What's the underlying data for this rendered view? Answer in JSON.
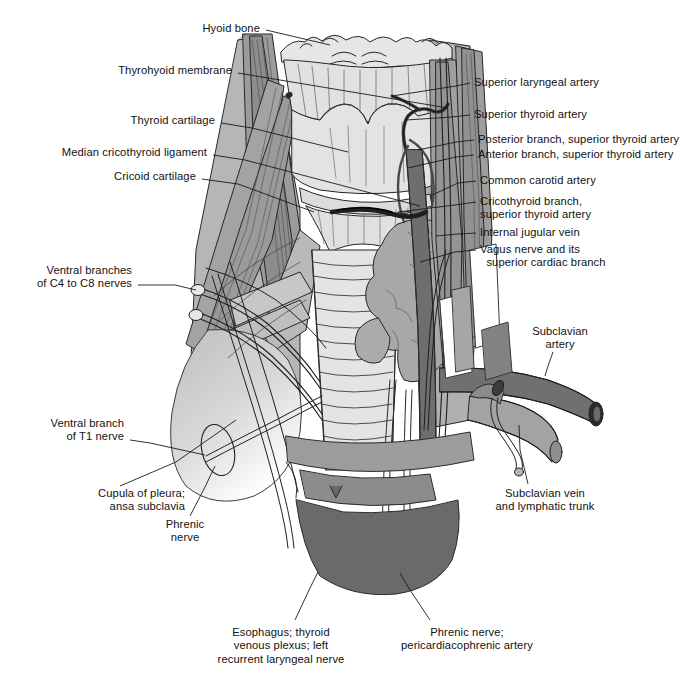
{
  "figure": {
    "domain": "anatomical-illustration",
    "background_color": "#ffffff",
    "line_color": "#1a1a1a",
    "text_color": "#111111",
    "palette": {
      "cartilage_light": "#e2e2e2",
      "cartilage_mid": "#d3d3d3",
      "muscle_light": "#c2c2c2",
      "muscle_mid": "#a6a6a6",
      "muscle_dark": "#8f8f8f",
      "vessel_dark": "#6e6e6e",
      "vessel_darker": "#5c5c5c",
      "gland_mid": "#a9a9a9",
      "pleura_pale": "#cfcfcf",
      "white": "#ffffff"
    }
  },
  "labels": [
    {
      "id": "hyoid-bone",
      "text": "Hyoid bone",
      "align": "right",
      "x": 260,
      "y": 22,
      "leader": [
        [
          266,
          30
        ],
        [
          330,
          45
        ]
      ]
    },
    {
      "id": "thyrohyoid-membrane",
      "text": "Thyrohyoid membrane",
      "align": "right",
      "x": 232,
      "y": 64,
      "leader": [
        [
          238,
          73
        ],
        [
          268,
          78
        ],
        [
          448,
          108
        ]
      ]
    },
    {
      "id": "thyroid-cartilage",
      "text": "Thyroid cartilage",
      "align": "right",
      "x": 215,
      "y": 114,
      "leader": [
        [
          221,
          123
        ],
        [
          252,
          128
        ],
        [
          348,
          152
        ]
      ]
    },
    {
      "id": "median-cricothyroid-ligament",
      "text": "Median cricothyroid ligament",
      "align": "right",
      "x": 207,
      "y": 146,
      "leader": [
        [
          213,
          155
        ],
        [
          245,
          160
        ],
        [
          420,
          206
        ]
      ]
    },
    {
      "id": "cricoid-cartilage",
      "text": "Cricoid cartilage",
      "align": "right",
      "x": 196,
      "y": 170,
      "leader": [
        [
          202,
          179
        ],
        [
          238,
          184
        ],
        [
          314,
          212
        ]
      ]
    },
    {
      "id": "ventral-branches-c4-c8",
      "text": "Ventral branches\nof C4 to C8 nerves",
      "align": "right",
      "x": 132,
      "y": 264,
      "leader": [
        [
          138,
          285
        ],
        [
          175,
          285
        ],
        [
          196,
          290
        ]
      ]
    },
    {
      "id": "ventral-branch-t1",
      "text": "Ventral branch\nof T1 nerve",
      "align": "right",
      "x": 124,
      "y": 417,
      "leader": [
        [
          130,
          440
        ],
        [
          150,
          443
        ],
        [
          205,
          455
        ]
      ]
    },
    {
      "id": "cupula-of-pleura",
      "text": "Cupula of pleura;\nansa subclavia",
      "align": "right",
      "x": 185,
      "y": 487,
      "leader": [
        [
          120,
          486
        ],
        [
          176,
          462
        ],
        [
          236,
          420
        ]
      ]
    },
    {
      "id": "phrenic-nerve",
      "text": "Phrenic\nnerve",
      "align": "center",
      "x": 185,
      "y": 518,
      "leader": [
        [
          190,
          516
        ],
        [
          205,
          487
        ],
        [
          215,
          466
        ]
      ]
    },
    {
      "id": "esophagus-thyroid-venous-plexus",
      "text": "Esophagus; thyroid\nvenous plexus; left\nrecurrent laryngeal nerve",
      "align": "center",
      "x": 281,
      "y": 626,
      "leader": [
        [
          295,
          620
        ],
        [
          310,
          588
        ],
        [
          318,
          572
        ]
      ]
    },
    {
      "id": "phrenic-nerve-pericardiacophrenic-artery",
      "text": "Phrenic nerve;\npericardiacophrenic artery",
      "align": "center",
      "x": 467,
      "y": 626,
      "leader": [
        [
          430,
          620
        ],
        [
          410,
          590
        ],
        [
          400,
          573
        ]
      ]
    },
    {
      "id": "superior-laryngeal-artery",
      "text": "Superior laryngeal artery",
      "align": "left",
      "x": 474,
      "y": 76,
      "leader": [
        [
          470,
          83
        ],
        [
          456,
          86
        ],
        [
          392,
          96
        ]
      ]
    },
    {
      "id": "superior-thyroid-artery",
      "text": "Superior thyroid artery",
      "align": "left",
      "x": 474,
      "y": 108,
      "leader": [
        [
          470,
          115
        ],
        [
          452,
          117
        ],
        [
          406,
          120
        ]
      ]
    },
    {
      "id": "posterior-branch-superior-thyroid-artery",
      "text": "Posterior branch, superior thyroid artery",
      "align": "left",
      "x": 478,
      "y": 133,
      "leader": [
        [
          474,
          140
        ],
        [
          456,
          142
        ],
        [
          418,
          150
        ]
      ]
    },
    {
      "id": "anterior-branch-superior-thyroid-artery",
      "text": "Anterior branch, superior thyroid artery",
      "align": "left",
      "x": 478,
      "y": 148,
      "leader": [
        [
          474,
          155
        ],
        [
          456,
          157
        ],
        [
          408,
          168
        ]
      ]
    },
    {
      "id": "common-carotid-artery",
      "text": "Common carotid artery",
      "align": "left",
      "x": 480,
      "y": 174,
      "leader": [
        [
          476,
          181
        ],
        [
          458,
          183
        ],
        [
          430,
          196
        ]
      ]
    },
    {
      "id": "cricothyroid-branch",
      "text": "Cricothyroid branch,\nsuperior thyroid artery",
      "align": "left",
      "x": 480,
      "y": 195,
      "leader": [
        [
          476,
          202
        ],
        [
          455,
          205
        ],
        [
          398,
          212
        ]
      ]
    },
    {
      "id": "internal-jugular-vein",
      "text": "Internal jugular vein",
      "align": "left",
      "x": 480,
      "y": 226,
      "leader": [
        [
          476,
          233
        ],
        [
          458,
          234
        ],
        [
          436,
          236
        ]
      ]
    },
    {
      "id": "vagus-nerve",
      "text": "Vagus nerve and its\n  superior cardiac branch",
      "align": "left",
      "x": 480,
      "y": 243,
      "leader": [
        [
          476,
          250
        ],
        [
          455,
          252
        ],
        [
          420,
          262
        ]
      ]
    },
    {
      "id": "subclavian-artery",
      "text": "Subclavian\nartery",
      "align": "center",
      "x": 560,
      "y": 325,
      "leader": [
        [
          553,
          352
        ],
        [
          548,
          366
        ],
        [
          545,
          376
        ]
      ]
    },
    {
      "id": "subclavian-vein",
      "text": "Subclavian vein\nand lymphatic trunk",
      "align": "center",
      "x": 545,
      "y": 487,
      "leader": [
        [
          528,
          484
        ],
        [
          520,
          450
        ],
        [
          519,
          425
        ]
      ]
    }
  ]
}
